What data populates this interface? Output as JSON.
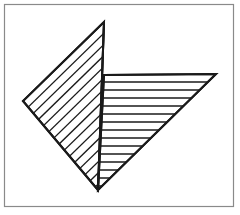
{
  "page": {
    "width": 240,
    "height": 215,
    "background_color": "#ffffff",
    "ink_color": "#1a1a1a"
  },
  "frame": {
    "name": "figure-border",
    "x": 4.5,
    "y": 4.5,
    "width": 229,
    "height": 202,
    "stroke_color": "#8a8a8a",
    "stroke_width": 1.2
  },
  "diagram": {
    "type": "line-art",
    "stroke_color": "#1a1a1a",
    "fill_color": "#ffffff",
    "outline_width": 2.0,
    "hatch_width": 1.3,
    "shapes": [
      {
        "name": "left-triangle",
        "label": "Left diagonally hatched triangle",
        "points": "104,22 23,101 98,190",
        "vertices": [
          {
            "name": "apex",
            "x": 104,
            "y": 22
          },
          {
            "name": "left",
            "x": 23,
            "y": 101
          },
          {
            "name": "bottom",
            "x": 98,
            "y": 190
          }
        ],
        "hatch": {
          "style": "diagonal",
          "angle_deg": 44,
          "spacing": 8.0,
          "count": 22,
          "direction": "parallel-to-upper-left-edge"
        }
      },
      {
        "name": "right-triangle",
        "label": "Right horizontally hatched triangle",
        "points": "104,75 216,74 98,190",
        "vertices": [
          {
            "name": "top-left",
            "x": 104,
            "y": 75
          },
          {
            "name": "top-right",
            "x": 216,
            "y": 74
          },
          {
            "name": "bottom",
            "x": 98,
            "y": 190
          }
        ],
        "hatch": {
          "style": "horizontal",
          "angle_deg": 0,
          "spacing": 8.0,
          "count": 14,
          "direction": "left-to-right"
        }
      }
    ],
    "shared_edge": {
      "name": "common-vertical-edge",
      "from": {
        "x": 104,
        "y": 22
      },
      "to": {
        "x": 98,
        "y": 190
      }
    }
  }
}
